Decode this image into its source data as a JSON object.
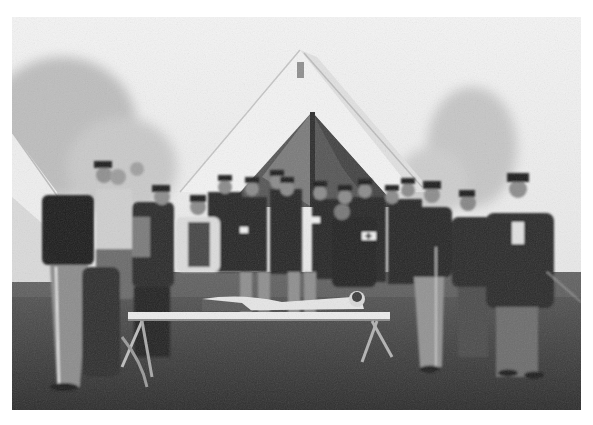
{
  "image": {
    "kind": "historical photograph",
    "tone": "black-and-white",
    "border_color": "#ffffff",
    "description": "A group of about eighteen uniformed soldiers, many in kepi caps, gathered in front of a large white canvas wedge tent in a foggy field, demonstrating field medical care on a man lying on a stretcher. Several men wear white armbands, one with a cross. An officer with a sword stands at right.",
    "palette": {
      "sky": "#ededed",
      "trees": "#c4c4c4",
      "tent": "#f2f2f2",
      "tent_opening": "#4a4a4a",
      "uniform_dark": "#1e1e1e",
      "uniform_mid": "#5a5a5a",
      "trousers_light": "#9a9a9a",
      "grass": "#3a3a3a",
      "stretcher": "#e8e8e8"
    },
    "elements": [
      {
        "name": "foggy-sky",
        "region": "top"
      },
      {
        "name": "trees-left",
        "region": "upper-left"
      },
      {
        "name": "trees-right",
        "region": "upper-right"
      },
      {
        "name": "small-tent-left",
        "region": "left-edge"
      },
      {
        "name": "large-wedge-tent",
        "region": "center"
      },
      {
        "name": "group-of-soldiers",
        "count_approx": 18
      },
      {
        "name": "stretcher-with-patient",
        "region": "center-lower"
      },
      {
        "name": "armband-red-cross",
        "region": "center-right"
      },
      {
        "name": "officer-with-sword",
        "region": "right"
      },
      {
        "name": "grass-field",
        "region": "bottom"
      }
    ]
  }
}
